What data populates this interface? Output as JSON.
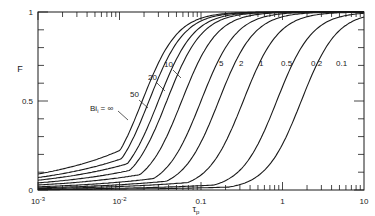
{
  "chart_data": {
    "type": "line",
    "title": "",
    "xlabel": "τp",
    "ylabel": "F",
    "xscale": "log",
    "xlim": [
      0.001,
      10
    ],
    "ylim": [
      0,
      1
    ],
    "x_ticks": [
      "10^-3",
      "10^-2",
      "0.1",
      "1",
      "10"
    ],
    "y_ticks": [
      "0",
      "0.5",
      "1"
    ],
    "grid": false,
    "legend": "inline labels on curves",
    "series": [
      {
        "name": "Bi = ∞",
        "label": "Bi = ∞",
        "tau_half": 0.019,
        "low_start": 0.09
      },
      {
        "name": "50",
        "label": "50",
        "tau_half": 0.023,
        "low_start": 0.07
      },
      {
        "name": "20",
        "label": "20",
        "tau_half": 0.03,
        "low_start": 0.055
      },
      {
        "name": "10",
        "label": "10",
        "tau_half": 0.038,
        "low_start": 0.04
      },
      {
        "name": "5",
        "label": "5",
        "tau_half": 0.058,
        "low_start": 0.028
      },
      {
        "name": "2",
        "label": "2",
        "tau_half": 0.1,
        "low_start": 0.018
      },
      {
        "name": "1",
        "label": "1",
        "tau_half": 0.165,
        "low_start": 0.012
      },
      {
        "name": "0.5",
        "label": "0.5",
        "tau_half": 0.33,
        "low_start": 0.008
      },
      {
        "name": "0.2",
        "label": "0.2",
        "tau_half": 0.85,
        "low_start": 0.004
      },
      {
        "name": "0.1",
        "label": "0.1",
        "tau_half": 1.7,
        "low_start": 0.002
      }
    ]
  },
  "axes": {
    "x_label_main": "τ",
    "x_label_sub": "p",
    "y_label": "F",
    "bi_prefix": "Bi",
    "bi_sub": "i",
    "bi_suffix": " = ∞"
  }
}
